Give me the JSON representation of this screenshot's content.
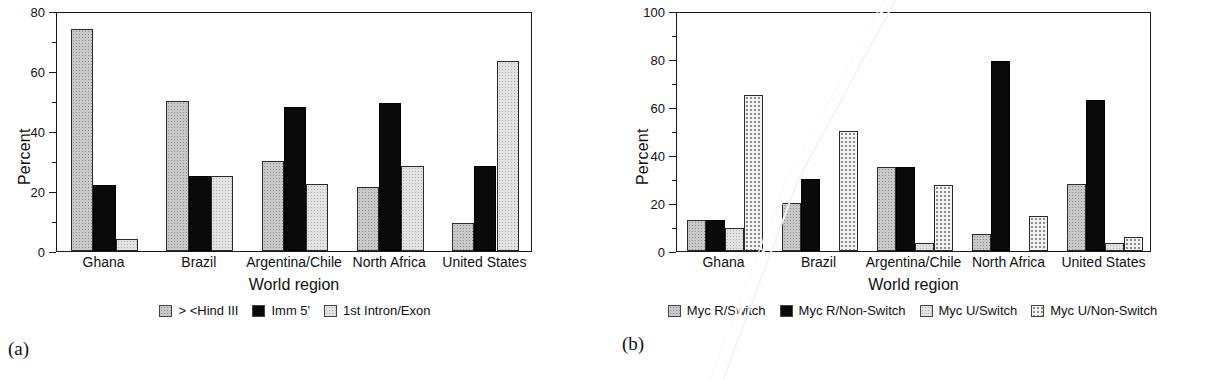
{
  "figure": {
    "panels": [
      {
        "tag": "(a)",
        "chart_data": {
          "type": "bar",
          "title": "",
          "xlabel": "World region",
          "ylabel": "Percent",
          "ylim": [
            0,
            80
          ],
          "yticks": [
            0,
            20,
            40,
            60,
            80
          ],
          "ytick_labels": [
            "0",
            "20",
            "40",
            "60",
            "80"
          ],
          "yminor_step": 10,
          "grid": false,
          "legend_position": "bottom",
          "categories": [
            "Ghana",
            "Brazil",
            "Argentina/Chile",
            "North Africa",
            "United States"
          ],
          "series": [
            {
              "name": "> <Hind III",
              "swatch": "gray",
              "values": [
                74.0,
                50.0,
                30.0,
                21.5,
                9.5
              ]
            },
            {
              "name": "Imm 5'",
              "swatch": "black",
              "values": [
                22.0,
                25.0,
                48.0,
                49.5,
                28.5
              ]
            },
            {
              "name": "1st Intron/Exon",
              "swatch": "light",
              "values": [
                4.0,
                25.0,
                22.5,
                28.5,
                63.5
              ]
            }
          ]
        }
      },
      {
        "tag": "(b)",
        "chart_data": {
          "type": "bar",
          "title": "",
          "xlabel": "World region",
          "ylabel": "Percent",
          "ylim": [
            0,
            100
          ],
          "yticks": [
            0,
            20,
            40,
            60,
            80,
            100
          ],
          "ytick_labels": [
            "0",
            "20",
            "40",
            "60",
            "80",
            "100"
          ],
          "yminor_step": 10,
          "grid": false,
          "legend_position": "bottom",
          "categories": [
            "Ghana",
            "Brazil",
            "Argentina/Chile",
            "North Africa",
            "United States"
          ],
          "series": [
            {
              "name": "Myc R/Switch",
              "swatch": "gray",
              "values": [
                13.0,
                20.0,
                35.0,
                7.0,
                28.0
              ]
            },
            {
              "name": "Myc R/Non-Switch",
              "swatch": "black",
              "values": [
                13.0,
                30.0,
                35.0,
                79.0,
                63.0
              ]
            },
            {
              "name": "Myc U/Switch",
              "swatch": "light",
              "values": [
                9.5,
                0.0,
                3.5,
                0.0,
                3.5
              ]
            },
            {
              "name": "Myc U/Non-Switch",
              "swatch": "dotted",
              "values": [
                65.0,
                50.0,
                27.5,
                14.5,
                6.0
              ]
            }
          ]
        }
      }
    ]
  }
}
